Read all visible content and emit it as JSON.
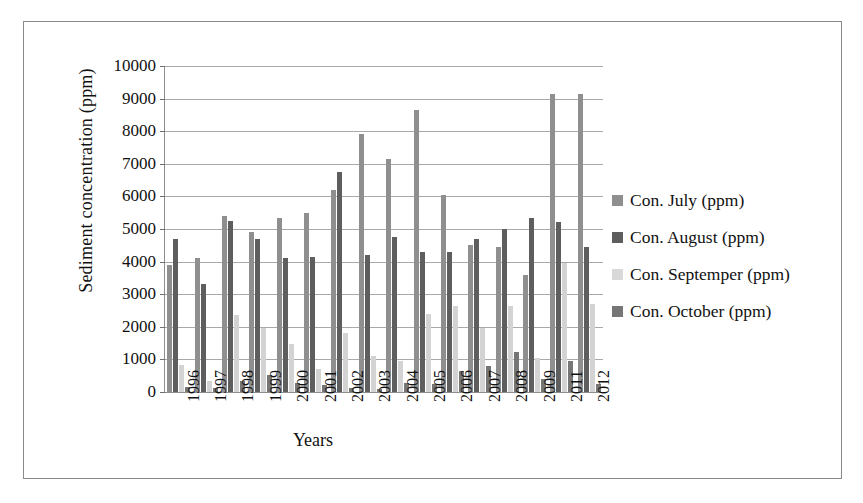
{
  "figure": {
    "frame_color": "#8a8a8a",
    "background": "#ffffff"
  },
  "chart_data": {
    "type": "bar",
    "title": "",
    "xlabel": "Years",
    "ylabel": "Sediment concentration (ppm)",
    "ylim": [
      0,
      10000
    ],
    "ytick_step": 1000,
    "yticks": [
      "10000",
      "9000",
      "8000",
      "7000",
      "6000",
      "5000",
      "4000",
      "3000",
      "2000",
      "1000",
      "0"
    ],
    "grid": true,
    "legend_position": "right",
    "categories": [
      "1996",
      "1997",
      "1998",
      "1999",
      "2000",
      "2001",
      "2002",
      "2003",
      "2004",
      "2005",
      "2006",
      "2007",
      "2008",
      "2009",
      "2011",
      "2012"
    ],
    "series": [
      {
        "name": "Con. July (ppm)",
        "color": "#8f8f8f",
        "values": [
          3900,
          4100,
          5400,
          4900,
          5350,
          5500,
          6200,
          7900,
          7150,
          8650,
          6050,
          4500,
          4450,
          3600,
          9150,
          9150
        ]
      },
      {
        "name": "Con. August (ppm)",
        "color": "#5e5e5e",
        "values": [
          4680,
          3320,
          5250,
          4700,
          4100,
          4150,
          6750,
          4200,
          4750,
          4300,
          4300,
          4700,
          5000,
          5350,
          5200,
          4450
        ]
      },
      {
        "name": "Con. Septemper (ppm)",
        "color": "#d3d3d3",
        "values": [
          830,
          340,
          2350,
          1950,
          1480,
          700,
          1800,
          1100,
          950,
          2400,
          2650,
          1950,
          2650,
          1050,
          3950,
          2700
        ]
      },
      {
        "name": "Con. October (ppm)",
        "color": "#767676",
        "values": [
          160,
          120,
          350,
          520,
          290,
          230,
          130,
          100,
          270,
          250,
          640,
          800,
          1230,
          400,
          950,
          250
        ]
      }
    ]
  },
  "legend": {
    "items": [
      {
        "label": "Con. July (ppm)",
        "color": "#8f8f8f"
      },
      {
        "label": "Con. August (ppm)",
        "color": "#5e5e5e"
      },
      {
        "label": "Con. Septemper (ppm)",
        "color": "#d9d9d9"
      },
      {
        "label": "Con. October (ppm)",
        "color": "#767676"
      }
    ]
  }
}
